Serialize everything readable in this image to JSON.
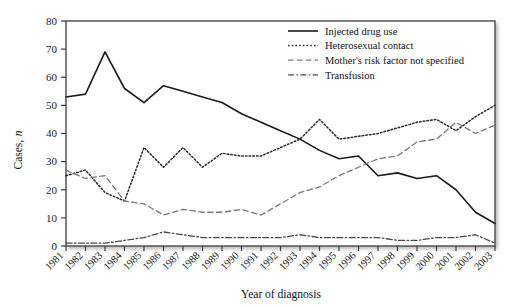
{
  "chart_data": {
    "type": "line",
    "title": "",
    "xlabel": "Year of diagnosis",
    "ylabel": "Cases, n",
    "ylabel_plain": "Cases,",
    "ylabel_italic": "n",
    "xlim": [
      1981,
      2003
    ],
    "ylim": [
      0,
      80
    ],
    "ytick_step": 10,
    "grid": false,
    "legend_position": "top-right",
    "categories": [
      1981,
      1982,
      1983,
      1984,
      1985,
      1986,
      1987,
      1988,
      1989,
      1990,
      1991,
      1992,
      1993,
      1994,
      1995,
      1996,
      1997,
      1998,
      1999,
      2000,
      2001,
      2002,
      2003
    ],
    "ytick_labels": [
      "0",
      "10",
      "20",
      "30",
      "40",
      "50",
      "60",
      "70",
      "80"
    ],
    "xtick_labels": [
      "1981",
      "1982",
      "1983",
      "1984",
      "1985",
      "1986",
      "1987",
      "1988",
      "1989",
      "1990",
      "1991",
      "1992",
      "1993",
      "1994",
      "1995",
      "1996",
      "1997",
      "1998",
      "1999",
      "2000",
      "2001",
      "2002",
      "2003"
    ],
    "series": [
      {
        "name": "Injected drug use",
        "style": "solid",
        "color": "#1a1a1a",
        "values": [
          53,
          54,
          69,
          56,
          51,
          57,
          55,
          53,
          51,
          47,
          44,
          41,
          38,
          34,
          31,
          32,
          25,
          26,
          24,
          25,
          20,
          12,
          8
        ]
      },
      {
        "name": "Heterosexual contact",
        "style": "dotted",
        "color": "#2b2b2b",
        "values": [
          25,
          27,
          19,
          16,
          35,
          28,
          35,
          28,
          33,
          32,
          32,
          35,
          38,
          45,
          38,
          39,
          40,
          42,
          44,
          45,
          41,
          46,
          50
        ]
      },
      {
        "name": "Mother's risk factor not specified",
        "style": "dashed",
        "color": "#7a7a7a",
        "values": [
          27,
          24,
          25,
          16,
          15,
          11,
          13,
          12,
          12,
          13,
          11,
          15,
          19,
          21,
          25,
          28,
          31,
          32,
          37,
          38,
          44,
          40,
          43
        ]
      },
      {
        "name": "Transfusion",
        "style": "dashdot",
        "color": "#4a4a4a",
        "values": [
          1,
          1,
          1,
          2,
          3,
          5,
          4,
          3,
          3,
          3,
          3,
          3,
          4,
          3,
          3,
          3,
          3,
          2,
          2,
          3,
          3,
          4,
          1
        ]
      }
    ]
  },
  "legend": {
    "items": [
      {
        "label": "Injected drug use"
      },
      {
        "label": "Heterosexual contact"
      },
      {
        "label": "Mother's risk factor not specified"
      },
      {
        "label": "Transfusion"
      }
    ]
  }
}
